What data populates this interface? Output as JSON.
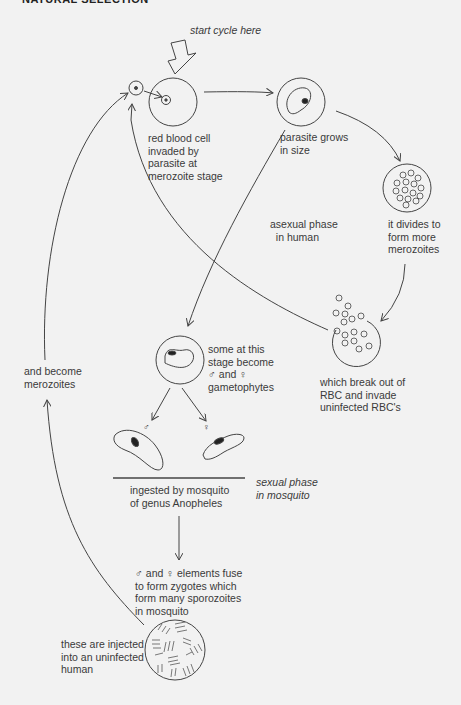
{
  "header": {
    "title": "NATURAL SELECTION"
  },
  "labels": {
    "start_cycle": "start cycle here",
    "rbc_invaded": "red blood cell\ninvaded by\nparasite at\nmerozoite stage",
    "parasite_grows": "parasite grows\nin size",
    "divides": "it divides to\nform more\nmerozoites",
    "asexual_phase": "asexual phase\n  in human",
    "break_out": "which break out of\nRBC and invade\nuninfected RBC's",
    "gametophytes": "some at this\nstage become\n♂ and ♀\ngametophytes",
    "become_merozoites": "and become\nmerozoites",
    "male_symbol": "♂",
    "female_symbol": "♀",
    "ingested": "ingested by mosquito\nof genus Anopheles",
    "sexual_phase": "sexual phase\nin mosquito",
    "fuse": "♂ and ♀ elements fuse\nto form zygotes which\nform many sporozoites\nin mosquito",
    "injected": "these are injected\ninto an uninfected\nhuman"
  },
  "colors": {
    "line": "#444444",
    "background": "#f2f2f2",
    "text": "#3a3a3a"
  }
}
